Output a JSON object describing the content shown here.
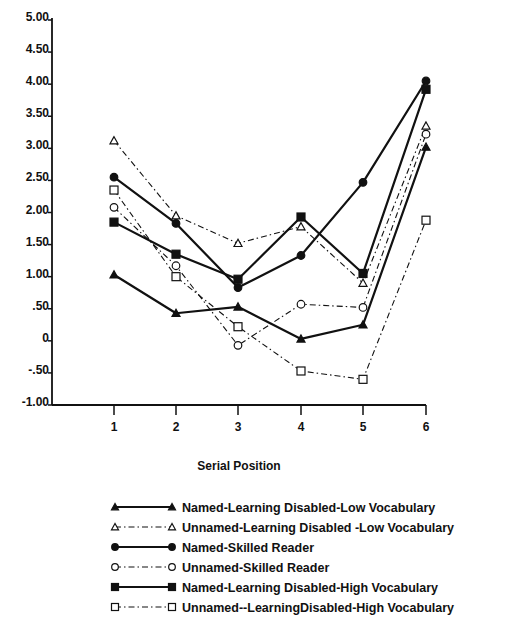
{
  "chart_data": {
    "type": "line",
    "title": "",
    "xlabel": "Serial Position",
    "ylabel": "",
    "x": [
      1,
      2,
      3,
      4,
      5,
      6
    ],
    "x_tick_labels": [
      "1",
      "2",
      "3",
      "4",
      "5",
      "6"
    ],
    "y_tick_labels": [
      "5.00",
      "4.50",
      "4.00",
      "3.50",
      "3.00",
      "2.50",
      "2.00",
      "1.50",
      "1.00",
      ".50",
      "0",
      "-.50",
      "-1.00"
    ],
    "y_ticks": [
      5.0,
      4.5,
      4.0,
      3.5,
      3.0,
      2.5,
      2.0,
      1.5,
      1.0,
      0.5,
      0,
      -0.5,
      -1.0
    ],
    "ylim": [
      -1.0,
      5.0
    ],
    "grid": false,
    "legend_position": "below",
    "series": [
      {
        "name": "Named-Learning Disabled-Low Vocabulary",
        "marker": "filled-triangle",
        "line": "solid",
        "values": [
          1.03,
          0.43,
          0.53,
          0.03,
          0.25,
          3.02
        ]
      },
      {
        "name": "Unnamed-Learning Disabled -Low Vocabulary",
        "marker": "open-triangle",
        "line": "dash-dot",
        "values": [
          3.12,
          1.95,
          1.52,
          1.78,
          0.9,
          3.35
        ]
      },
      {
        "name": "Named-Skilled Reader",
        "marker": "filled-circle",
        "line": "solid",
        "values": [
          2.55,
          1.83,
          0.83,
          1.33,
          2.47,
          4.05
        ]
      },
      {
        "name": "Unnamed-Skilled Reader",
        "marker": "open-circle",
        "line": "dash-dot",
        "values": [
          2.08,
          1.17,
          -0.07,
          0.57,
          0.52,
          3.22
        ]
      },
      {
        "name": "Named-Learning Disabled-High Vocabulary",
        "marker": "filled-square",
        "line": "solid",
        "values": [
          1.85,
          1.35,
          0.96,
          1.93,
          1.05,
          3.92
        ]
      },
      {
        "name": "Unnamed--LearningDisabled-High Vocabulary",
        "marker": "open-square",
        "line": "dash-dot",
        "values": [
          2.35,
          1.0,
          0.22,
          -0.47,
          -0.6,
          1.88
        ]
      }
    ]
  },
  "legend": {
    "items": [
      {
        "label": "Named-Learning Disabled-Low Vocabulary"
      },
      {
        "label": "Unnamed-Learning Disabled -Low Vocabulary"
      },
      {
        "label": "Named-Skilled Reader"
      },
      {
        "label": "Unnamed-Skilled Reader"
      },
      {
        "label": "Named-Learning Disabled-High Vocabulary"
      },
      {
        "label": "Unnamed--LearningDisabled-High Vocabulary"
      }
    ]
  },
  "colors": {
    "ink": "#111111",
    "background": "#ffffff"
  }
}
